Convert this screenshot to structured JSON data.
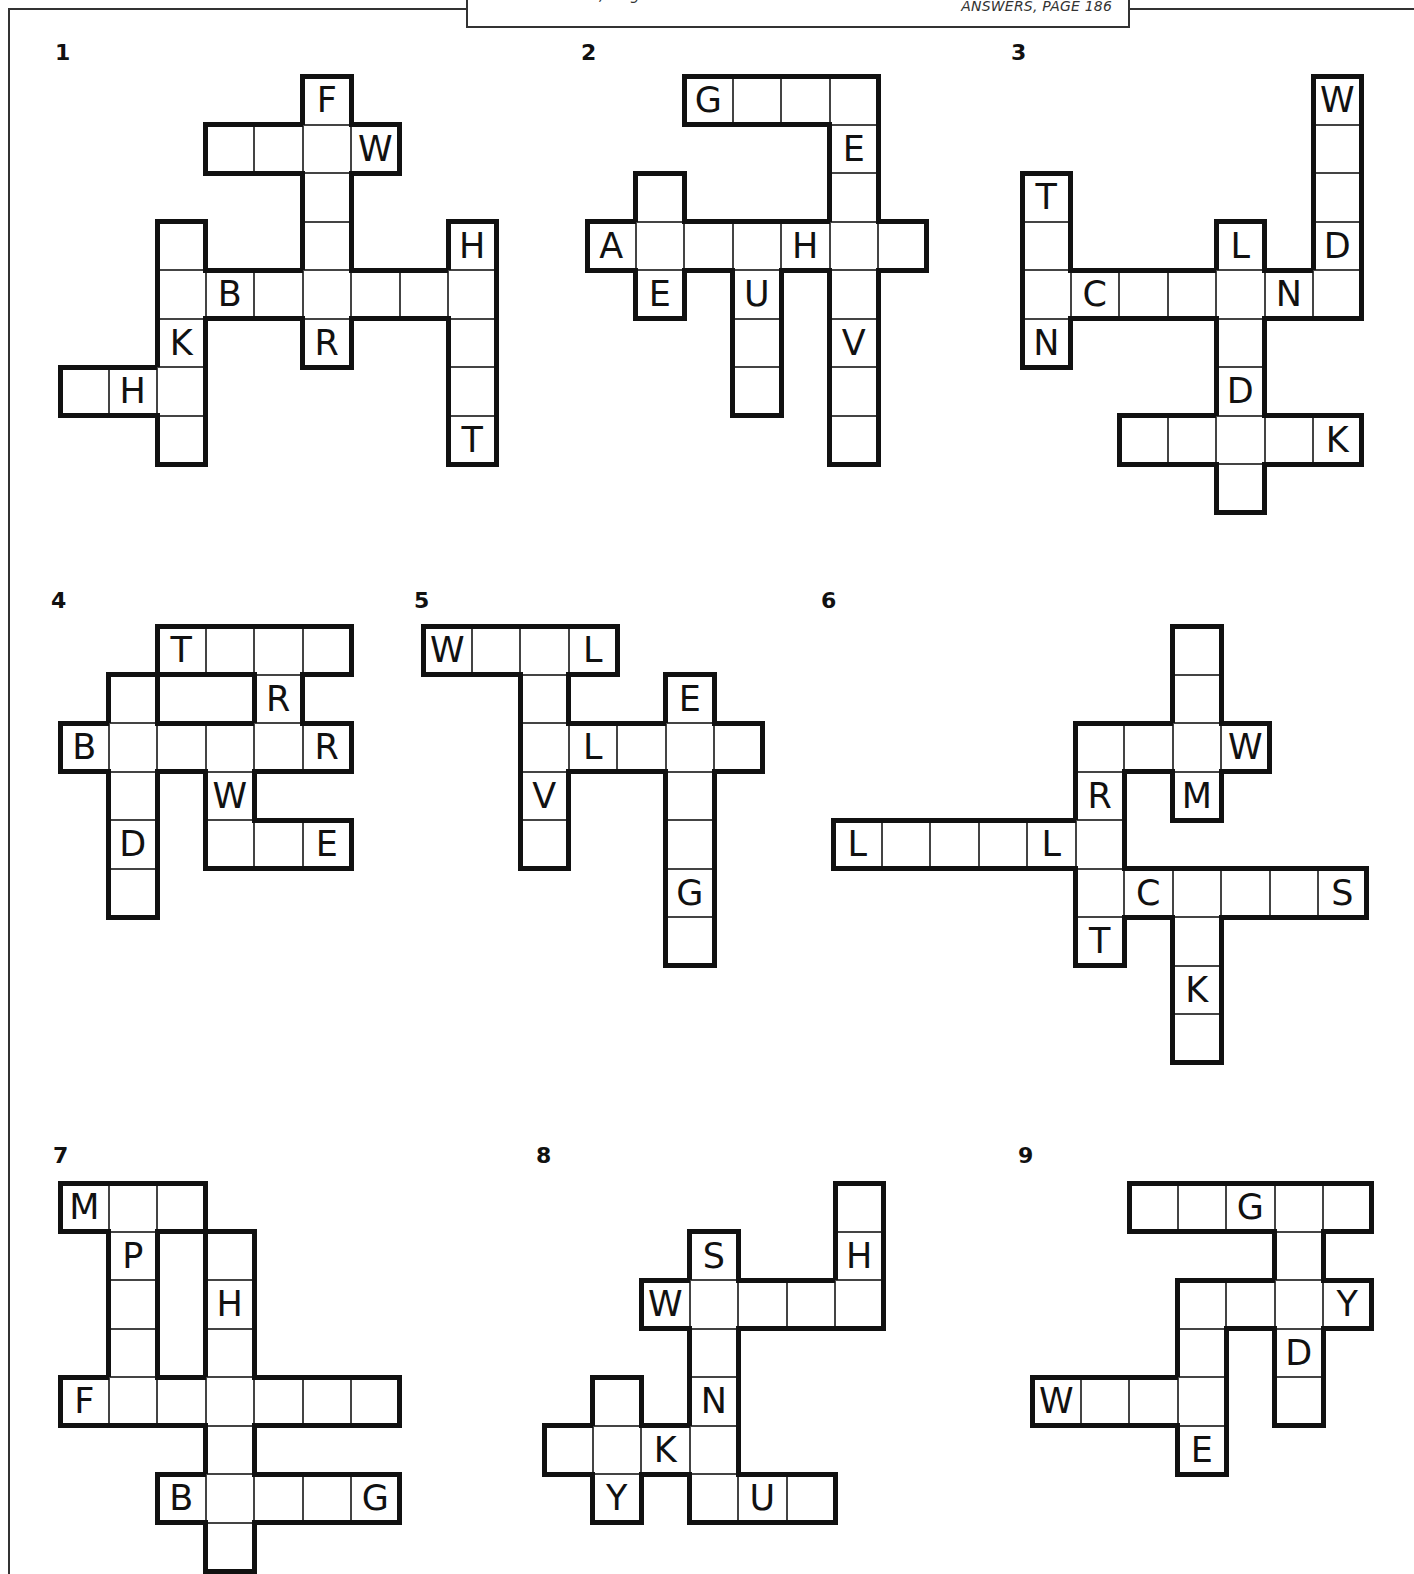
{
  "header": {
    "cut_text": "takes is four, so get to it.",
    "answers_ref": "ANSWERS, PAGE 186"
  },
  "grid": {
    "cell_size": 48.5,
    "border_color": "#111111",
    "thin_line_color": "#444444"
  },
  "puzzles": [
    {
      "number": "1",
      "label_pos": [
        55,
        40
      ],
      "origin": [
        60,
        76
      ],
      "cells": [
        [
          5,
          0,
          "F"
        ],
        [
          3,
          1,
          ""
        ],
        [
          4,
          1,
          ""
        ],
        [
          5,
          1,
          ""
        ],
        [
          6,
          1,
          "W"
        ],
        [
          5,
          2,
          ""
        ],
        [
          2,
          3,
          ""
        ],
        [
          5,
          3,
          ""
        ],
        [
          8,
          3,
          "H"
        ],
        [
          2,
          4,
          ""
        ],
        [
          3,
          4,
          "B"
        ],
        [
          4,
          4,
          ""
        ],
        [
          5,
          4,
          ""
        ],
        [
          6,
          4,
          ""
        ],
        [
          7,
          4,
          ""
        ],
        [
          8,
          4,
          ""
        ],
        [
          2,
          5,
          "K"
        ],
        [
          5,
          5,
          "R"
        ],
        [
          8,
          5,
          ""
        ],
        [
          0,
          6,
          ""
        ],
        [
          1,
          6,
          "H"
        ],
        [
          2,
          6,
          ""
        ],
        [
          8,
          6,
          ""
        ],
        [
          2,
          7,
          ""
        ],
        [
          8,
          7,
          "T"
        ]
      ]
    },
    {
      "number": "2",
      "label_pos": [
        581,
        40
      ],
      "origin": [
        587,
        76
      ],
      "cells": [
        [
          2,
          0,
          "G"
        ],
        [
          3,
          0,
          ""
        ],
        [
          4,
          0,
          ""
        ],
        [
          5,
          0,
          ""
        ],
        [
          5,
          1,
          "E"
        ],
        [
          1,
          2,
          ""
        ],
        [
          5,
          2,
          ""
        ],
        [
          0,
          3,
          "A"
        ],
        [
          1,
          3,
          ""
        ],
        [
          2,
          3,
          ""
        ],
        [
          3,
          3,
          ""
        ],
        [
          4,
          3,
          "H"
        ],
        [
          5,
          3,
          ""
        ],
        [
          6,
          3,
          ""
        ],
        [
          1,
          4,
          "E"
        ],
        [
          3,
          4,
          "U"
        ],
        [
          5,
          4,
          ""
        ],
        [
          3,
          5,
          ""
        ],
        [
          5,
          5,
          "V"
        ],
        [
          3,
          6,
          ""
        ],
        [
          5,
          6,
          ""
        ],
        [
          5,
          7,
          ""
        ]
      ]
    },
    {
      "number": "3",
      "label_pos": [
        1011,
        40
      ],
      "origin": [
        1022,
        76
      ],
      "cells": [
        [
          6,
          0,
          "W"
        ],
        [
          6,
          1,
          ""
        ],
        [
          0,
          2,
          "T"
        ],
        [
          6,
          2,
          ""
        ],
        [
          0,
          3,
          ""
        ],
        [
          4,
          3,
          "L"
        ],
        [
          6,
          3,
          "D"
        ],
        [
          0,
          4,
          ""
        ],
        [
          1,
          4,
          "C"
        ],
        [
          2,
          4,
          ""
        ],
        [
          3,
          4,
          ""
        ],
        [
          4,
          4,
          ""
        ],
        [
          5,
          4,
          "N"
        ],
        [
          6,
          4,
          ""
        ],
        [
          0,
          5,
          "N"
        ],
        [
          4,
          5,
          ""
        ],
        [
          4,
          6,
          "D"
        ],
        [
          2,
          7,
          ""
        ],
        [
          3,
          7,
          ""
        ],
        [
          4,
          7,
          ""
        ],
        [
          5,
          7,
          ""
        ],
        [
          6,
          7,
          "K"
        ],
        [
          4,
          8,
          ""
        ]
      ]
    },
    {
      "number": "4",
      "label_pos": [
        51,
        588
      ],
      "origin": [
        60,
        626
      ],
      "cells": [
        [
          2,
          0,
          "T"
        ],
        [
          3,
          0,
          ""
        ],
        [
          4,
          0,
          ""
        ],
        [
          5,
          0,
          ""
        ],
        [
          1,
          1,
          ""
        ],
        [
          4,
          1,
          "R"
        ],
        [
          0,
          2,
          "B"
        ],
        [
          1,
          2,
          ""
        ],
        [
          2,
          2,
          ""
        ],
        [
          3,
          2,
          ""
        ],
        [
          4,
          2,
          ""
        ],
        [
          5,
          2,
          "R"
        ],
        [
          1,
          3,
          ""
        ],
        [
          3,
          3,
          "W"
        ],
        [
          1,
          4,
          "D"
        ],
        [
          3,
          4,
          ""
        ],
        [
          4,
          4,
          ""
        ],
        [
          5,
          4,
          "E"
        ],
        [
          1,
          5,
          ""
        ]
      ]
    },
    {
      "number": "5",
      "label_pos": [
        414,
        588
      ],
      "origin": [
        423,
        626
      ],
      "cells": [
        [
          0,
          0,
          "W"
        ],
        [
          1,
          0,
          ""
        ],
        [
          2,
          0,
          ""
        ],
        [
          3,
          0,
          "L"
        ],
        [
          2,
          1,
          ""
        ],
        [
          5,
          1,
          "E"
        ],
        [
          2,
          2,
          ""
        ],
        [
          3,
          2,
          "L"
        ],
        [
          4,
          2,
          ""
        ],
        [
          5,
          2,
          ""
        ],
        [
          6,
          2,
          ""
        ],
        [
          2,
          3,
          "V"
        ],
        [
          5,
          3,
          ""
        ],
        [
          2,
          4,
          ""
        ],
        [
          5,
          4,
          ""
        ],
        [
          5,
          5,
          "G"
        ],
        [
          5,
          6,
          ""
        ]
      ]
    },
    {
      "number": "6",
      "label_pos": [
        821,
        588
      ],
      "origin": [
        833,
        626
      ],
      "cells": [
        [
          7,
          0,
          ""
        ],
        [
          7,
          1,
          ""
        ],
        [
          5,
          2,
          ""
        ],
        [
          6,
          2,
          ""
        ],
        [
          7,
          2,
          ""
        ],
        [
          8,
          2,
          "W"
        ],
        [
          5,
          3,
          "R"
        ],
        [
          7,
          3,
          "M"
        ],
        [
          0,
          4,
          "L"
        ],
        [
          1,
          4,
          ""
        ],
        [
          2,
          4,
          ""
        ],
        [
          3,
          4,
          ""
        ],
        [
          4,
          4,
          "L"
        ],
        [
          5,
          4,
          ""
        ],
        [
          5,
          5,
          ""
        ],
        [
          6,
          5,
          "C"
        ],
        [
          7,
          5,
          ""
        ],
        [
          8,
          5,
          ""
        ],
        [
          9,
          5,
          ""
        ],
        [
          10,
          5,
          "S"
        ],
        [
          5,
          6,
          "T"
        ],
        [
          7,
          6,
          ""
        ],
        [
          7,
          7,
          "K"
        ],
        [
          7,
          8,
          ""
        ]
      ]
    },
    {
      "number": "7",
      "label_pos": [
        53,
        1143
      ],
      "origin": [
        60,
        1183
      ],
      "cells": [
        [
          0,
          0,
          "M"
        ],
        [
          1,
          0,
          ""
        ],
        [
          2,
          0,
          ""
        ],
        [
          1,
          1,
          "P"
        ],
        [
          3,
          1,
          ""
        ],
        [
          1,
          2,
          ""
        ],
        [
          3,
          2,
          "H"
        ],
        [
          1,
          3,
          ""
        ],
        [
          3,
          3,
          ""
        ],
        [
          0,
          4,
          "F"
        ],
        [
          1,
          4,
          ""
        ],
        [
          2,
          4,
          ""
        ],
        [
          3,
          4,
          ""
        ],
        [
          4,
          4,
          ""
        ],
        [
          5,
          4,
          ""
        ],
        [
          6,
          4,
          ""
        ],
        [
          3,
          5,
          ""
        ],
        [
          2,
          6,
          "B"
        ],
        [
          3,
          6,
          ""
        ],
        [
          4,
          6,
          ""
        ],
        [
          5,
          6,
          ""
        ],
        [
          6,
          6,
          "G"
        ],
        [
          3,
          7,
          ""
        ]
      ]
    },
    {
      "number": "8",
      "label_pos": [
        536,
        1143
      ],
      "origin": [
        544,
        1183
      ],
      "cells": [
        [
          6,
          0,
          ""
        ],
        [
          3,
          1,
          "S"
        ],
        [
          6,
          1,
          "H"
        ],
        [
          2,
          2,
          "W"
        ],
        [
          3,
          2,
          ""
        ],
        [
          4,
          2,
          ""
        ],
        [
          5,
          2,
          ""
        ],
        [
          6,
          2,
          ""
        ],
        [
          3,
          3,
          ""
        ],
        [
          1,
          4,
          ""
        ],
        [
          3,
          4,
          "N"
        ],
        [
          0,
          5,
          ""
        ],
        [
          1,
          5,
          ""
        ],
        [
          2,
          5,
          "K"
        ],
        [
          3,
          5,
          ""
        ],
        [
          1,
          6,
          "Y"
        ],
        [
          3,
          6,
          ""
        ],
        [
          4,
          6,
          "U"
        ],
        [
          5,
          6,
          ""
        ]
      ]
    },
    {
      "number": "9",
      "label_pos": [
        1018,
        1143
      ],
      "origin": [
        1032,
        1183
      ],
      "cells": [
        [
          2,
          0,
          ""
        ],
        [
          3,
          0,
          ""
        ],
        [
          4,
          0,
          "G"
        ],
        [
          5,
          0,
          ""
        ],
        [
          6,
          0,
          ""
        ],
        [
          5,
          1,
          ""
        ],
        [
          3,
          2,
          ""
        ],
        [
          4,
          2,
          ""
        ],
        [
          5,
          2,
          ""
        ],
        [
          6,
          2,
          "Y"
        ],
        [
          3,
          3,
          ""
        ],
        [
          5,
          3,
          "D"
        ],
        [
          0,
          4,
          "W"
        ],
        [
          1,
          4,
          ""
        ],
        [
          2,
          4,
          ""
        ],
        [
          3,
          4,
          ""
        ],
        [
          5,
          4,
          ""
        ],
        [
          3,
          5,
          "E"
        ]
      ]
    }
  ]
}
